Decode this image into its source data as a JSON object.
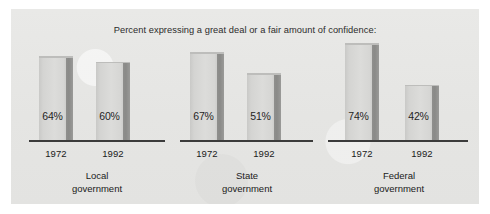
{
  "chart_data": {
    "type": "bar",
    "title": "Percent expressing a great deal or a fair amount of confidence:",
    "xlabel": "",
    "ylabel": "",
    "ylim": [
      0,
      100
    ],
    "grid": false,
    "legend": "none",
    "categories": [
      "Local government",
      "State government",
      "Federal government"
    ],
    "series": [
      {
        "name": "1972",
        "values": [
          64,
          67,
          74
        ]
      },
      {
        "name": "1992",
        "values": [
          60,
          51,
          42
        ]
      }
    ],
    "value_labels": [
      [
        "64%",
        "60%"
      ],
      [
        "67%",
        "51%"
      ],
      [
        "74%",
        "42%"
      ]
    ],
    "tick_labels": [
      "1972",
      "1992"
    ],
    "bar_color": "#d6d6d4",
    "bar_shadow_color": "#8c8c8a",
    "axis_color": "#3b3b3b",
    "panel_color": "#e7e7e5",
    "text_color": "#202020"
  },
  "chart": {
    "title": "Percent expressing a great deal or a fair amount of confidence:",
    "groups": [
      {
        "name_line1": "Local",
        "name_line2": "government",
        "bars": [
          {
            "year": "1972",
            "value_label": "64%",
            "value": 64
          },
          {
            "year": "1992",
            "value_label": "60%",
            "value": 60
          }
        ]
      },
      {
        "name_line1": "State",
        "name_line2": "government",
        "bars": [
          {
            "year": "1972",
            "value_label": "67%",
            "value": 67
          },
          {
            "year": "1992",
            "value_label": "51%",
            "value": 51
          }
        ]
      },
      {
        "name_line1": "Federal",
        "name_line2": "government",
        "bars": [
          {
            "year": "1972",
            "value_label": "74%",
            "value": 74
          },
          {
            "year": "1992",
            "value_label": "42%",
            "value": 42
          }
        ]
      }
    ]
  }
}
